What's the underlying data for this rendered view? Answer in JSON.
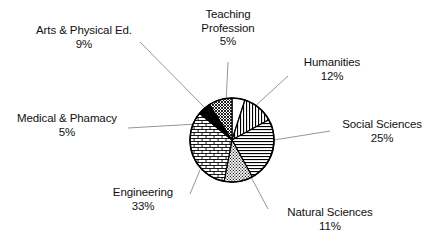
{
  "chart_data": {
    "type": "pie",
    "title": "",
    "subtitle": "",
    "xlabel": "",
    "ylabel": "",
    "legend_position": "none",
    "grid": false,
    "units": "percent",
    "total": 100,
    "categories": [
      "Teaching Profession",
      "Humanities",
      "Social Sciences",
      "Natural Sciences",
      "Engineering",
      "Medical & Phamacy",
      "Arts & Physical Ed."
    ],
    "values": [
      5,
      12,
      25,
      11,
      33,
      5,
      9
    ],
    "slices": [
      {
        "name": "Teaching Profession",
        "label_line1": "Teaching",
        "label_line2": "Profession",
        "value": 5,
        "percent_text": "5%",
        "fill_pattern": "blank-white",
        "start_angle_deg": 0,
        "end_angle_deg": 18
      },
      {
        "name": "Humanities",
        "label_line1": "Humanities",
        "label_line2": "",
        "value": 12,
        "percent_text": "12%",
        "fill_pattern": "vertical-lines",
        "start_angle_deg": 18,
        "end_angle_deg": 61.2
      },
      {
        "name": "Social Sciences",
        "label_line1": "Social Sciences",
        "label_line2": "",
        "value": 25,
        "percent_text": "25%",
        "fill_pattern": "horizontal-lines",
        "start_angle_deg": 61.2,
        "end_angle_deg": 151.2
      },
      {
        "name": "Natural Sciences",
        "label_line1": "Natural Sciences",
        "label_line2": "",
        "value": 11,
        "percent_text": "11%",
        "fill_pattern": "fine-dot-scale",
        "start_angle_deg": 151.2,
        "end_angle_deg": 190.8
      },
      {
        "name": "Engineering",
        "label_line1": "Engineering",
        "label_line2": "",
        "value": 33,
        "percent_text": "33%",
        "fill_pattern": "brick",
        "start_angle_deg": 190.8,
        "end_angle_deg": 309.6
      },
      {
        "name": "Medical & Phamacy",
        "label_line1": "Medical & Phamacy",
        "label_line2": "",
        "value": 5,
        "percent_text": "5%",
        "fill_pattern": "solid-black",
        "start_angle_deg": 309.6,
        "end_angle_deg": 327.6
      },
      {
        "name": "Arts & Physical Ed.",
        "label_line1": "Arts & Physical Ed.",
        "label_line2": "",
        "value": 9,
        "percent_text": "9%",
        "fill_pattern": "cross-hatch",
        "start_angle_deg": 327.6,
        "end_angle_deg": 360
      }
    ],
    "colors": {
      "outline": "#000000",
      "background": "#ffffff",
      "leader_line": "#8a8a8a",
      "text": "#111111",
      "solid_slice": "#000000"
    }
  },
  "labels": {
    "arts": {
      "name": "Arts & Physical Ed.",
      "percent": "9%"
    },
    "teaching": {
      "line1": "Teaching",
      "line2": "Profession",
      "percent": "5%"
    },
    "humanities": {
      "name": "Humanities",
      "percent": "12%"
    },
    "medical": {
      "name": "Medical & Phamacy",
      "percent": "5%"
    },
    "social": {
      "name": "Social Sciences",
      "percent": "25%"
    },
    "engineering": {
      "name": "Engineering",
      "percent": "33%"
    },
    "natural": {
      "name": "Natural Sciences",
      "percent": "11%"
    }
  }
}
